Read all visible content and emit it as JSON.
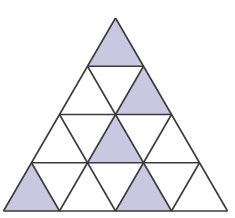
{
  "diagram": {
    "type": "triangular-grid",
    "rows": 4,
    "colors": {
      "shade": "#c9c8e0",
      "stroke": "#3a3a3a",
      "background": "#ffffff"
    },
    "shaded_cells": [
      {
        "row": 1,
        "index": 1,
        "orientation": "up"
      },
      {
        "row": 2,
        "index": 2,
        "orientation": "up"
      },
      {
        "row": 3,
        "index": 2,
        "orientation": "up"
      },
      {
        "row": 4,
        "index": 1,
        "orientation": "up"
      },
      {
        "row": 4,
        "index": 3,
        "orientation": "up"
      }
    ]
  }
}
